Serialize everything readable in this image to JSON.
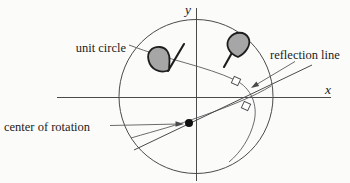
{
  "figure": {
    "labels": {
      "unit_circle": "unit circle",
      "reflection_line": "reflection line",
      "center_of_rotation": "center of rotation",
      "x_axis": "x",
      "y_axis": "y"
    },
    "colors": {
      "line": "#4a4a4a",
      "text": "#1c1c1c",
      "flag_fill": "#a6a6a6",
      "flag_outline": "#1d1d1d",
      "dot": "#111111",
      "background": "#fbfbfa"
    }
  }
}
